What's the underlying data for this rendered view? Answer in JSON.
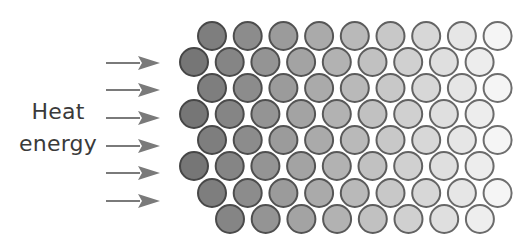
{
  "diagram": {
    "label": {
      "line1": "Heat",
      "line2": "energy"
    },
    "colors": {
      "text": "#3a3a3a",
      "arrow": "#7a7a7a",
      "particle_dark_fill": "#767676",
      "particle_light_fill": "#f6f6f6",
      "particle_dark_stroke": "#464646",
      "particle_light_stroke": "#6e6e6e",
      "background": "#ffffff"
    },
    "arrows": {
      "count": 6,
      "x_start": 106,
      "x_end": 160,
      "head_length": 22,
      "head_half_height": 7,
      "shaft_width": 2.2,
      "y_centers": [
        63,
        90,
        118,
        146,
        173,
        201
      ]
    },
    "particles": {
      "radius": 14,
      "stroke_width": 2,
      "col_spacing": 35.7,
      "gradient_x_min": 194,
      "gradient_x_max": 500,
      "rows": [
        {
          "y": 36,
          "x_start": 212,
          "count": 9
        },
        {
          "y": 62,
          "x_start": 194,
          "count": 9
        },
        {
          "y": 88,
          "x_start": 212,
          "count": 9
        },
        {
          "y": 114,
          "x_start": 194,
          "count": 9
        },
        {
          "y": 140,
          "x_start": 212,
          "count": 9
        },
        {
          "y": 166,
          "x_start": 194,
          "count": 9
        },
        {
          "y": 193,
          "x_start": 212,
          "count": 9
        },
        {
          "y": 219,
          "x_start": 230,
          "count": 8
        }
      ]
    }
  }
}
